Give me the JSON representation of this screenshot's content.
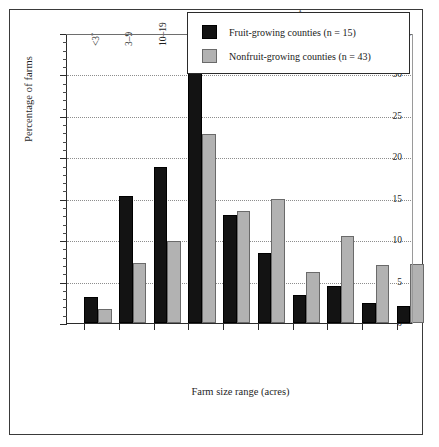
{
  "chart_data": {
    "type": "bar",
    "title": "",
    "xlabel": "Farm size range (acres)",
    "ylabel": "Percentage of farms",
    "ylim": [
      0,
      35
    ],
    "yticks": [
      0,
      5,
      10,
      15,
      20,
      25,
      30,
      35
    ],
    "grid": true,
    "legend_position": "top-right",
    "categories": [
      "<3",
      "3–9",
      "10–19",
      "20–49",
      "50–99",
      "100–174",
      "175–259",
      "260–499",
      "500–999",
      ">1,000"
    ],
    "category_marks": [
      "*",
      "",
      "",
      "",
      "*",
      "",
      "*",
      "",
      "",
      ""
    ],
    "series": [
      {
        "name": "Fruit-growing counties (n = 15)",
        "color": "#131313",
        "values": [
          3.1,
          15.3,
          18.8,
          30.3,
          13.0,
          8.5,
          3.4,
          4.5,
          2.4,
          2.1
        ]
      },
      {
        "name": "Nonfruit-growing counties (n = 43)",
        "color": "#b2b2b2",
        "values": [
          1.7,
          7.2,
          9.9,
          22.8,
          13.5,
          15.0,
          6.2,
          10.5,
          7.0,
          7.1
        ]
      }
    ]
  },
  "legend": {
    "entries": [
      {
        "label": "Fruit-growing counties (n = 15)",
        "swatch": "dark"
      },
      {
        "label": "Nonfruit-growing counties (n = 43)",
        "swatch": "light"
      }
    ]
  },
  "axes": {
    "y_title": "Percentage of farms",
    "x_title": "Farm size range (acres)",
    "y_tick_labels": [
      "0",
      "5",
      "10",
      "15",
      "20",
      "25",
      "30",
      "35"
    ]
  }
}
